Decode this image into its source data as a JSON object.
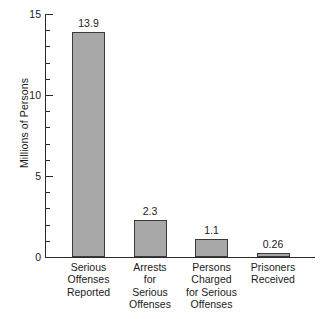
{
  "chart_data": {
    "type": "bar",
    "title": "",
    "subtitle": "",
    "xlabel": "",
    "ylabel": "Millions of Persons",
    "ylim": [
      0,
      15
    ],
    "xlim_note": "categorical",
    "grid": false,
    "legend": false,
    "legend_position": "none",
    "y_major_ticks": [
      0,
      5,
      10,
      15
    ],
    "y_tick_labels": [
      "0",
      "5",
      "10",
      "15"
    ],
    "y_minor_tick_interval": 1,
    "categories": [
      "Serious\nOffenses\nReported",
      "Arrests\nfor\nSerious\nOffenses",
      "Persons\nCharged\nfor Serious\nOffenses",
      "Prisoners\nReceived"
    ],
    "values": [
      13.9,
      2.3,
      1.1,
      0.26
    ],
    "value_labels": [
      "13.9",
      "2.3",
      "1.1",
      "0.26"
    ],
    "bar_fill_color": "#a8a8a8",
    "bar_border_color": "#3a3a3a",
    "axis_color": "#2b2b2b",
    "background_color": "#ffffff"
  },
  "axis": {
    "y_title": "Millions of Persons",
    "ticks": [
      {
        "label": "15",
        "value": 15
      },
      {
        "label": "10",
        "value": 10
      },
      {
        "label": "5",
        "value": 5
      },
      {
        "label": "0",
        "value": 0
      }
    ]
  },
  "bars": [
    {
      "label": "Serious\nOffenses\nReported",
      "value": 13.9,
      "value_label": "13.9"
    },
    {
      "label": "Arrests\nfor\nSerious\nOffenses",
      "value": 2.3,
      "value_label": "2.3"
    },
    {
      "label": "Persons\nCharged\nfor Serious\nOffenses",
      "value": 1.1,
      "value_label": "1.1"
    },
    {
      "label": "Prisoners\nReceived",
      "value": 0.26,
      "value_label": "0.26"
    }
  ]
}
